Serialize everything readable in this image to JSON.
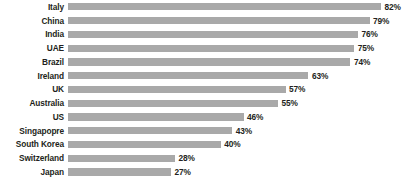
{
  "chart_data": {
    "type": "bar",
    "orientation": "horizontal",
    "title": "",
    "subtitle": "",
    "xlabel": "",
    "ylabel": "",
    "xlim": [
      0,
      82
    ],
    "grid": false,
    "legend": null,
    "bar_color": "#a9a9a9",
    "label_color": "#231f20",
    "background": "#ffffff",
    "categories": [
      "Italy",
      "China",
      "India",
      "UAE",
      "Brazil",
      "Ireland",
      "UK",
      "Australia",
      "US",
      "Singapopre",
      "South Korea",
      "Switzerland",
      "Japan"
    ],
    "values": [
      82,
      79,
      76,
      75,
      74,
      63,
      57,
      55,
      46,
      43,
      40,
      28,
      27
    ],
    "value_labels": [
      "82%",
      "79%",
      "76%",
      "75%",
      "74%",
      "63%",
      "57%",
      "55%",
      "46%",
      "43%",
      "40%",
      "28%",
      "27%"
    ]
  }
}
